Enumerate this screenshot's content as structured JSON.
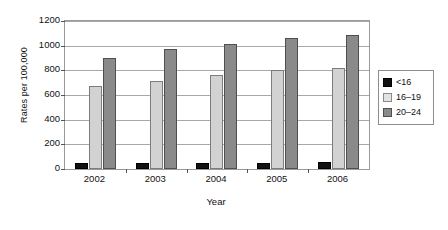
{
  "chart_data": {
    "type": "bar",
    "title": "",
    "xlabel": "Year",
    "ylabel": "Rates per 100,000",
    "categories": [
      "2002",
      "2003",
      "2004",
      "2005",
      "2006"
    ],
    "series": [
      {
        "name": "<16",
        "color": "#111111",
        "values": [
          45,
          45,
          50,
          50,
          55
        ]
      },
      {
        "name": "16–19",
        "color": "#d2d2d2",
        "values": [
          675,
          715,
          760,
          800,
          820
        ]
      },
      {
        "name": "20–24",
        "color": "#8a8a8a",
        "values": [
          900,
          975,
          1015,
          1065,
          1090
        ]
      }
    ],
    "ylim": [
      0,
      1200
    ],
    "yticks": [
      0,
      200,
      400,
      600,
      800,
      1000,
      1200
    ],
    "ytick_labels": [
      "0",
      "200",
      "400",
      "600",
      "800",
      "1000",
      "1200"
    ],
    "grid": true,
    "legend_position": "right",
    "legend_entries": [
      "<16",
      "16–19",
      "20–24"
    ]
  }
}
